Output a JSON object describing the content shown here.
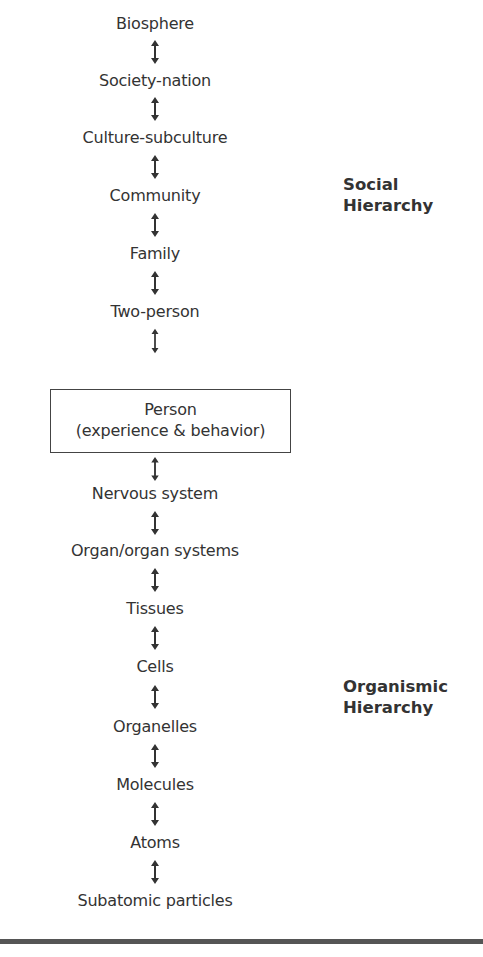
{
  "diagram": {
    "type": "hierarchy",
    "levels": [
      {
        "label": "Biosphere"
      },
      {
        "label": "Society-nation"
      },
      {
        "label": "Culture-subculture"
      },
      {
        "label": "Community"
      },
      {
        "label": "Family"
      },
      {
        "label": "Two-person"
      },
      {
        "label": "Person",
        "sublabel": "(experience & behavior)",
        "boxed": true
      },
      {
        "label": "Nervous system"
      },
      {
        "label": "Organ/organ systems"
      },
      {
        "label": "Tissues"
      },
      {
        "label": "Cells"
      },
      {
        "label": "Organelles"
      },
      {
        "label": "Molecules"
      },
      {
        "label": "Atoms"
      },
      {
        "label": "Subatomic particles"
      }
    ],
    "connector": "bidirectional-vertical-arrow",
    "groups": [
      {
        "line1": "Social",
        "line2": "Hierarchy"
      },
      {
        "line1": "Organismic",
        "line2": "Hierarchy"
      }
    ],
    "colors": {
      "text": "#333333",
      "rule": "#555555",
      "box_border": "#444444"
    }
  }
}
